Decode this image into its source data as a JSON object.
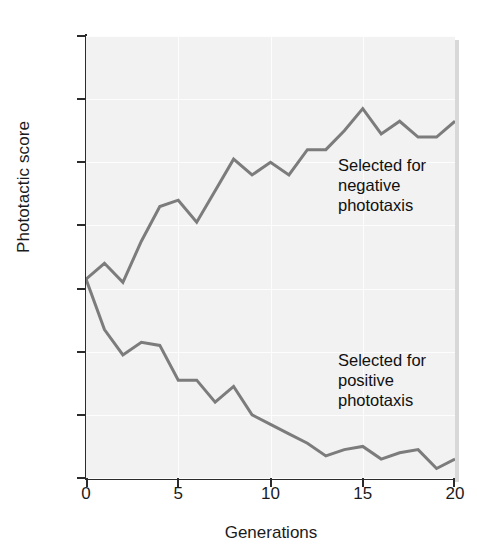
{
  "chart_data": {
    "type": "line",
    "title": "",
    "subtitle": "",
    "xlabel": "Generations",
    "ylabel": "Phototactic score",
    "xlim": [
      0,
      20
    ],
    "ylim": [
      1,
      15
    ],
    "y_axis_inverted": true,
    "grid": true,
    "legend_position": "inline-annotation",
    "xticks": [
      "0",
      "5",
      "10",
      "15",
      "20"
    ],
    "xtick_values": [
      0,
      5,
      10,
      15,
      20
    ],
    "yticks": [
      "1",
      "3",
      "5",
      "7",
      "9",
      "11",
      "13",
      "15"
    ],
    "ytick_values": [
      1,
      3,
      5,
      7,
      9,
      11,
      13,
      15
    ],
    "x": [
      0,
      1,
      2,
      3,
      4,
      5,
      6,
      7,
      8,
      9,
      10,
      11,
      12,
      13,
      14,
      15,
      16,
      17,
      18,
      19,
      20
    ],
    "series": [
      {
        "name": "Selected for negative phototaxis",
        "color": "#7c7c7c",
        "annotation": "Selected for\nnegative\nphototaxis",
        "values": [
          8.7,
          8.2,
          8.8,
          7.5,
          6.4,
          6.2,
          6.9,
          5.9,
          4.9,
          5.4,
          5.0,
          5.4,
          4.6,
          4.6,
          4.0,
          3.3,
          4.1,
          3.7,
          4.2,
          4.2,
          3.7
        ]
      },
      {
        "name": "Selected for positive phototaxis",
        "color": "#7c7c7c",
        "annotation": "Selected for\npositive\nphototaxis",
        "values": [
          8.7,
          10.3,
          11.1,
          10.7,
          10.8,
          11.9,
          11.9,
          12.6,
          12.1,
          13.0,
          13.3,
          13.6,
          13.9,
          14.3,
          14.1,
          14.0,
          14.4,
          14.2,
          14.1,
          14.7,
          14.4
        ]
      }
    ]
  },
  "annotations": {
    "negative": "Selected for\nnegative\nphototaxis",
    "positive": "Selected for\npositive\nphototaxis"
  }
}
